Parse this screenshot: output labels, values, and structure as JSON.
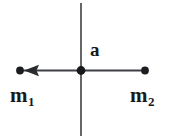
{
  "diagram": {
    "background_color": "#ffffff",
    "stroke_color": "#4a4a4a",
    "dot_color": "#1a1a1a",
    "text_color": "#1a1a1a",
    "labels": {
      "acceleration": "a",
      "mass_left_base": "m",
      "mass_left_subscript": "1",
      "mass_right_base": "m",
      "mass_right_subscript": "2"
    },
    "geometry": {
      "vertical_axis": {
        "x": 81,
        "y_top": 3,
        "y_bottom": 136
      },
      "horizontal_axis": {
        "y": 70,
        "x_left": 20,
        "x_right": 145
      },
      "center_point": {
        "x": 81,
        "y": 70,
        "radius": 4
      },
      "left_point": {
        "x": 20,
        "y": 70,
        "radius": 3.6
      },
      "right_point": {
        "x": 145,
        "y": 70,
        "radius": 3.6
      },
      "arrow_head": {
        "tip_x": 25,
        "back_x": 38,
        "y": 70,
        "half_height": 5,
        "direction": "left"
      }
    }
  }
}
